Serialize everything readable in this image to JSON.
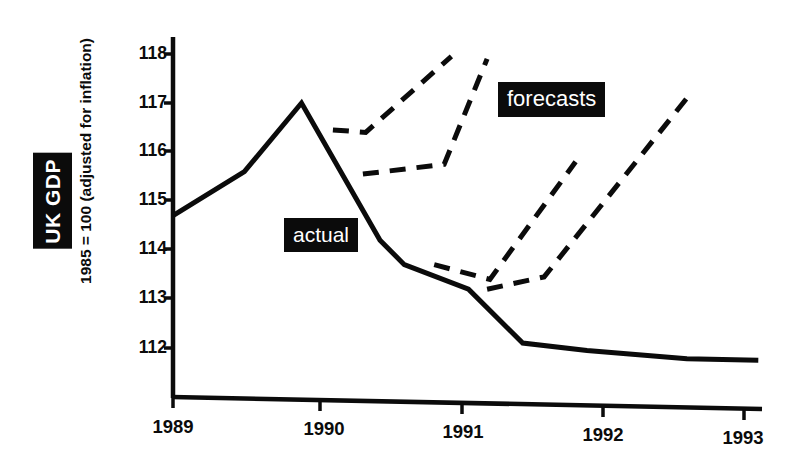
{
  "axis": {
    "y_title_badge": "UK GDP",
    "y_title_sub": "1985 = 100 (adjusted for inflation)",
    "y_ticks": [
      "118",
      "117",
      "116",
      "115",
      "114",
      "113",
      "112"
    ],
    "x_ticks": [
      "1989",
      "1990",
      "1991",
      "1992",
      "1993"
    ]
  },
  "annotations": {
    "actual_label": "actual",
    "forecasts_label": "forecasts"
  },
  "colors": {
    "ink": "#0b0b0b",
    "background": "#ffffff",
    "badge_text": "#ffffff"
  },
  "chart_data": {
    "type": "line",
    "title": "",
    "subtitle": "",
    "xlabel": "",
    "ylabel": "UK GDP, 1985 = 100 (adjusted for inflation)",
    "xlim": [
      1989.0,
      1993.35
    ],
    "ylim": [
      111.4,
      118.25
    ],
    "grid": false,
    "legend": "inline-labels",
    "ytick_values": [
      118,
      117,
      116,
      115,
      114,
      113,
      112
    ],
    "xtick_values": [
      1989,
      1990,
      1991,
      1992,
      1993
    ],
    "series": [
      {
        "name": "actual",
        "style": "solid",
        "x": [
          1989.0,
          1989.5,
          1989.9,
          1990.45,
          1990.62,
          1991.07,
          1991.45,
          1991.9,
          1992.6,
          1993.1
        ],
        "values": [
          114.7,
          115.6,
          117.0,
          114.2,
          113.7,
          113.2,
          112.1,
          111.95,
          111.78,
          111.75
        ]
      },
      {
        "name": "forecast-1",
        "style": "dashed",
        "x": [
          1990.12,
          1990.35,
          1990.95
        ],
        "values": [
          116.45,
          116.4,
          117.95
        ]
      },
      {
        "name": "forecast-2",
        "style": "dashed",
        "x": [
          1990.33,
          1990.9,
          1991.2
        ],
        "values": [
          115.55,
          115.75,
          117.9
        ]
      },
      {
        "name": "forecast-3",
        "style": "dashed",
        "x": [
          1990.83,
          1991.22,
          1991.82
        ],
        "values": [
          113.7,
          113.4,
          115.8
        ]
      },
      {
        "name": "forecast-4",
        "style": "dashed",
        "x": [
          1991.2,
          1991.6,
          1992.6
        ],
        "values": [
          113.2,
          113.45,
          117.1
        ]
      }
    ]
  }
}
